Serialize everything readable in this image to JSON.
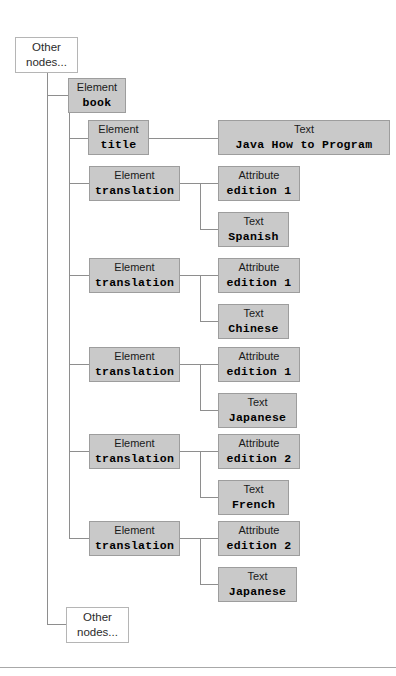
{
  "diagram": {
    "colors": {
      "node_fill": "#c9c9c9",
      "node_border": "#9d9d9d",
      "plain_fill": "#ffffff",
      "plain_border": "#b5b5b5",
      "line": "#8e8e8e",
      "rule": "#a8a8a8",
      "text": "#000000",
      "background": "#ffffff"
    },
    "top_placeholder": {
      "line1": "Other",
      "line2": "nodes..."
    },
    "bottom_placeholder": {
      "line1": "Other",
      "line2": "nodes..."
    },
    "root": {
      "kind": "Element",
      "value": "book"
    },
    "title_node": {
      "kind": "Element",
      "value": "title"
    },
    "title_text": {
      "kind": "Text",
      "value": "Java How to Program"
    },
    "translations": [
      {
        "element": {
          "kind": "Element",
          "value": "translation"
        },
        "attribute": {
          "kind": "Attribute",
          "value": "edition 1"
        },
        "text": {
          "kind": "Text",
          "value": "Spanish"
        }
      },
      {
        "element": {
          "kind": "Element",
          "value": "translation"
        },
        "attribute": {
          "kind": "Attribute",
          "value": "edition 1"
        },
        "text": {
          "kind": "Text",
          "value": "Chinese"
        }
      },
      {
        "element": {
          "kind": "Element",
          "value": "translation"
        },
        "attribute": {
          "kind": "Attribute",
          "value": "edition 1"
        },
        "text": {
          "kind": "Text",
          "value": "Japanese"
        }
      },
      {
        "element": {
          "kind": "Element",
          "value": "translation"
        },
        "attribute": {
          "kind": "Attribute",
          "value": "edition 2"
        },
        "text": {
          "kind": "Text",
          "value": "French"
        }
      },
      {
        "element": {
          "kind": "Element",
          "value": "translation"
        },
        "attribute": {
          "kind": "Attribute",
          "value": "edition 2"
        },
        "text": {
          "kind": "Text",
          "value": "Japanese"
        }
      }
    ]
  }
}
